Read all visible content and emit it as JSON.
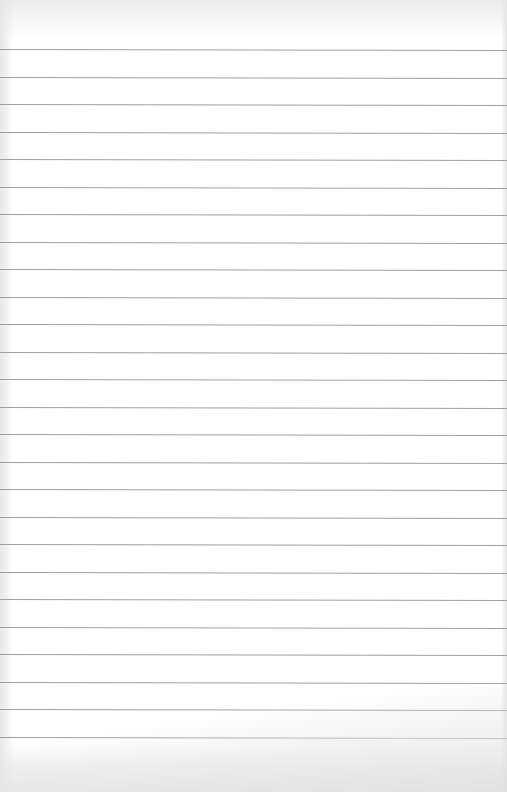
{
  "scene": {
    "subject": "blank lined notebook paper",
    "paper_color": "#ffffff",
    "rule_color": "#8f8f8f",
    "rule_count": 26,
    "first_rule_y": 49,
    "rule_spacing_px": 27.5
  }
}
